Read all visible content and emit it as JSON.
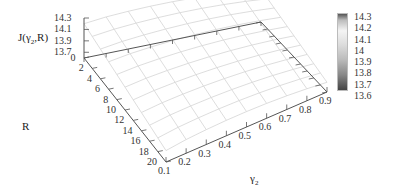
{
  "chart_data": {
    "type": "surface3d",
    "title": "",
    "zlabel": "J(γ2,R)",
    "xlabel": "γ2",
    "ylabel": "R",
    "x_ticks": [
      "0.1",
      "0.2",
      "0.3",
      "0.4",
      "0.5",
      "0.6",
      "0.7",
      "0.8",
      "0.9"
    ],
    "y_ticks": [
      "0",
      "2",
      "4",
      "6",
      "8",
      "10",
      "12",
      "14",
      "16",
      "18",
      "20"
    ],
    "z_ticks": [
      "13.7",
      "13.9",
      "14.1",
      "14.3"
    ],
    "xlim": [
      0.1,
      0.9
    ],
    "ylim": [
      0,
      20
    ],
    "zlim": [
      13.6,
      14.3
    ],
    "colorbar": {
      "ticks": [
        "14.3",
        "14.2",
        "14.1",
        "14",
        "13.9",
        "13.8",
        "13.7",
        "13.6"
      ],
      "range": [
        13.6,
        14.3
      ],
      "colormap": "grayscale"
    },
    "surface": {
      "x": [
        0.1,
        0.2,
        0.3,
        0.4,
        0.5,
        0.6,
        0.7,
        0.8,
        0.9
      ],
      "y": [
        0,
        2,
        4,
        6,
        8,
        10,
        12,
        14,
        16,
        18,
        20
      ],
      "note": "surface approx: higher near low R and mid gamma, decreasing toward large R",
      "z_grid": [
        [
          14.2,
          14.24,
          14.26,
          14.27,
          14.27,
          14.26,
          14.24,
          14.21,
          14.17
        ],
        [
          14.16,
          14.2,
          14.22,
          14.23,
          14.23,
          14.22,
          14.2,
          14.17,
          14.13
        ],
        [
          14.12,
          14.16,
          14.18,
          14.19,
          14.19,
          14.18,
          14.16,
          14.13,
          14.09
        ],
        [
          14.08,
          14.12,
          14.14,
          14.15,
          14.15,
          14.14,
          14.12,
          14.09,
          14.05
        ],
        [
          14.04,
          14.08,
          14.1,
          14.11,
          14.11,
          14.1,
          14.08,
          14.05,
          14.01
        ],
        [
          14.0,
          14.04,
          14.06,
          14.07,
          14.07,
          14.06,
          14.04,
          14.01,
          13.97
        ],
        [
          13.96,
          14.0,
          14.02,
          14.03,
          14.03,
          14.02,
          14.0,
          13.97,
          13.93
        ],
        [
          13.92,
          13.96,
          13.98,
          13.99,
          13.99,
          13.98,
          13.96,
          13.93,
          13.89
        ],
        [
          13.88,
          13.92,
          13.94,
          13.95,
          13.95,
          13.94,
          13.92,
          13.89,
          13.85
        ],
        [
          13.84,
          13.88,
          13.9,
          13.91,
          13.91,
          13.9,
          13.88,
          13.85,
          13.81
        ],
        [
          13.8,
          13.84,
          13.86,
          13.87,
          13.87,
          13.86,
          13.84,
          13.81,
          13.77
        ]
      ]
    },
    "grid": false,
    "legend_position": "right colorbar"
  },
  "labels": {
    "zlabel": "J(γ",
    "zlabel_sub": "2",
    "zlabel_tail": ",R)",
    "xlabel": "γ",
    "xlabel_sub": "2",
    "ylabel": "R"
  },
  "colors": {
    "axis": "#555555",
    "mesh": "#d4d4d4",
    "cb_top": "#555555",
    "cb_light": "#f4f4f4",
    "cb_bottom": "#444444"
  }
}
